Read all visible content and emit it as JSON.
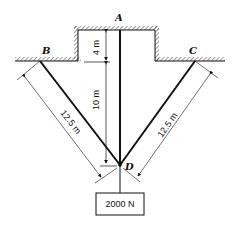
{
  "diagram": {
    "points": {
      "A": "A",
      "B": "B",
      "C": "C",
      "D": "D"
    },
    "dimensions": {
      "a_to_ledge": "4 m",
      "ledge_to_d": "10 m",
      "bd_length": "12.5 m",
      "cd_length": "12.5 m"
    },
    "load": {
      "label": "2000 N"
    },
    "colors": {
      "ink": "#111111",
      "background": "#ffffff"
    }
  }
}
